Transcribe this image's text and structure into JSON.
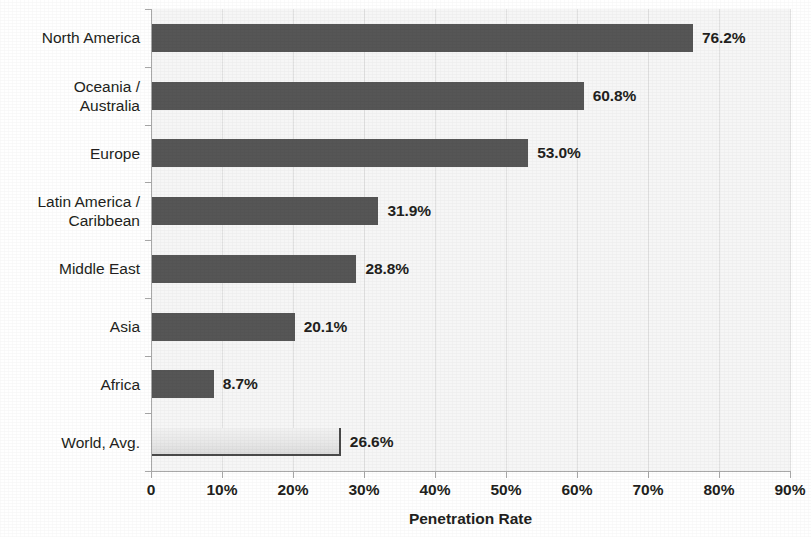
{
  "chart_data": {
    "type": "bar",
    "orientation": "horizontal",
    "title": "",
    "xlabel": "Penetration Rate",
    "ylabel": "",
    "xlim": [
      0,
      90
    ],
    "grid": true,
    "legend": "none",
    "categories": [
      "North America",
      "Oceania /\nAustralia",
      "Europe",
      "Latin America /\nCaribbean",
      "Middle East",
      "Asia",
      "Africa",
      "World, Avg."
    ],
    "values": [
      76.2,
      60.8,
      53.0,
      31.9,
      28.8,
      20.1,
      8.7,
      26.6
    ],
    "value_labels": [
      "76.2%",
      "60.8%",
      "53.0%",
      "31.9%",
      "28.8%",
      "20.1%",
      "8.7%",
      "26.6%"
    ],
    "highlight_index": 7,
    "xticks": [
      0,
      10,
      20,
      30,
      40,
      50,
      60,
      70,
      80,
      90
    ],
    "xtick_labels": [
      "0",
      "10%",
      "20%",
      "30%",
      "40%",
      "50%",
      "60%",
      "70%",
      "80%",
      "90%"
    ],
    "colors": {
      "bar": "#565656",
      "highlight_bar": "#e8e8e8",
      "highlight_border": "#4a4a4a",
      "plot_background": "#f6f6f6",
      "gridline": "#e2e2e2",
      "axis": "#a8a8a8",
      "text": "#231f20"
    }
  }
}
